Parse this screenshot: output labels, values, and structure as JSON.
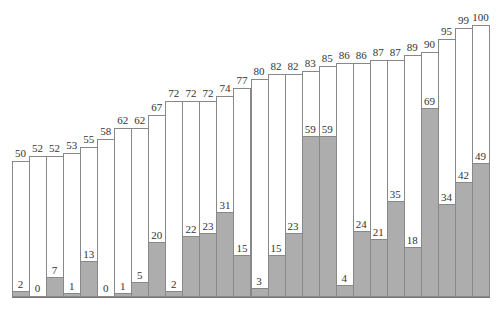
{
  "chart_data": {
    "type": "bar",
    "title": "",
    "xlabel": "",
    "ylabel": "",
    "ylim": [
      0,
      100
    ],
    "grid": false,
    "legend": null,
    "categories": [
      "1",
      "2",
      "3",
      "4",
      "5",
      "6",
      "7",
      "8",
      "9",
      "10",
      "11",
      "12",
      "13",
      "14",
      "15",
      "16",
      "17",
      "18",
      "19",
      "20",
      "21",
      "22",
      "23",
      "24",
      "25",
      "26",
      "27",
      "28"
    ],
    "series": [
      {
        "name": "total",
        "values": [
          50,
          52,
          52,
          53,
          55,
          58,
          62,
          62,
          67,
          72,
          72,
          72,
          74,
          77,
          80,
          82,
          82,
          83,
          85,
          86,
          86,
          87,
          87,
          89,
          90,
          95,
          99,
          100
        ]
      },
      {
        "name": "filled",
        "values": [
          2,
          0,
          7,
          1,
          13,
          0,
          1,
          5,
          20,
          2,
          22,
          23,
          31,
          15,
          3,
          15,
          23,
          59,
          59,
          4,
          24,
          21,
          35,
          18,
          69,
          34,
          42,
          49
        ]
      }
    ]
  },
  "colors": {
    "fill": "#adadad",
    "outline": "#888888",
    "background": "#ffffff"
  }
}
